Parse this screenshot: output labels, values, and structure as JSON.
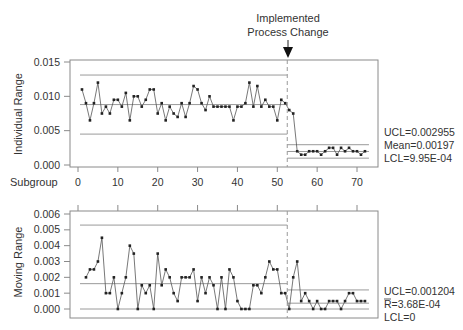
{
  "annotation": {
    "line1": "Implemented",
    "line2": "Process Change",
    "subgroup": 52.5
  },
  "chart_data": [
    {
      "type": "line",
      "title": "Individuals Chart",
      "xlabel": "Subgroup",
      "ylabel": "Individual Range",
      "xlim": [
        0,
        72
      ],
      "ylim": [
        0,
        0.015
      ],
      "x_ticks": [
        "0",
        "10",
        "20",
        "30",
        "40",
        "50",
        "60",
        "70"
      ],
      "y_ticks": [
        "0.000",
        "0.005",
        "0.010",
        "0.015"
      ],
      "phase1": {
        "ucl": 0.0131,
        "mean": 0.0088,
        "lcl": 0.0045
      },
      "phase2": {
        "ucl": 0.002955,
        "mean": 0.00197,
        "lcl": 0.000995
      },
      "stats_labels": [
        "UCL=0.002955",
        "Mean=0.00197",
        "LCL=9.95E-04"
      ],
      "series": [
        {
          "name": "Individual",
          "x": [
            1,
            2,
            3,
            4,
            5,
            6,
            7,
            8,
            9,
            10,
            11,
            12,
            13,
            14,
            15,
            16,
            17,
            18,
            19,
            20,
            21,
            22,
            23,
            24,
            25,
            26,
            27,
            28,
            29,
            30,
            31,
            32,
            33,
            34,
            35,
            36,
            37,
            38,
            39,
            40,
            41,
            42,
            43,
            44,
            45,
            46,
            47,
            48,
            49,
            50,
            51,
            52,
            53,
            54,
            55,
            56,
            57,
            58,
            59,
            60,
            61,
            62,
            63,
            64,
            65,
            66,
            67,
            68,
            69,
            70,
            71,
            72
          ],
          "values": [
            0.011,
            0.009,
            0.0065,
            0.009,
            0.012,
            0.0075,
            0.0085,
            0.0075,
            0.0095,
            0.0095,
            0.0085,
            0.0105,
            0.0065,
            0.01,
            0.01,
            0.0085,
            0.0095,
            0.011,
            0.011,
            0.0075,
            0.009,
            0.0065,
            0.0085,
            0.0075,
            0.007,
            0.009,
            0.007,
            0.009,
            0.0115,
            0.011,
            0.009,
            0.008,
            0.01,
            0.0085,
            0.0085,
            0.0085,
            0.0085,
            0.0085,
            0.0065,
            0.0085,
            0.0085,
            0.009,
            0.012,
            0.0085,
            0.0115,
            0.0085,
            0.0095,
            0.0085,
            0.0085,
            0.0065,
            0.0095,
            0.009,
            0.008,
            0.0075,
            0.002,
            0.0015,
            0.0015,
            0.002,
            0.002,
            0.002,
            0.0015,
            0.002,
            0.0025,
            0.0025,
            0.0015,
            0.0025,
            0.002,
            0.0025,
            0.002,
            0.002,
            0.0015,
            0.002,
            0.002,
            0.002
          ]
        }
      ]
    },
    {
      "type": "line",
      "title": "Moving Range Chart",
      "xlabel": "",
      "ylabel": "Moving Range",
      "xlim": [
        0,
        72
      ],
      "ylim": [
        0,
        0.006
      ],
      "y_ticks": [
        "0.000",
        "0.001",
        "0.002",
        "0.003",
        "0.004",
        "0.005",
        "0.006"
      ],
      "phase1": {
        "ucl": 0.0053,
        "mean": 0.0016,
        "lcl": 0
      },
      "phase2": {
        "ucl": 0.001204,
        "mean": 0.000368,
        "lcl": 0
      },
      "stats_labels": [
        "UCL=0.001204",
        "R=3.68E-04",
        "LCL=0"
      ],
      "series": [
        {
          "name": "Moving Range",
          "x": [
            2,
            3,
            4,
            5,
            6,
            7,
            8,
            9,
            10,
            11,
            12,
            13,
            14,
            15,
            16,
            17,
            18,
            19,
            20,
            21,
            22,
            23,
            24,
            25,
            26,
            27,
            28,
            29,
            30,
            31,
            32,
            33,
            34,
            35,
            36,
            37,
            38,
            39,
            40,
            41,
            42,
            43,
            44,
            45,
            46,
            47,
            48,
            49,
            50,
            51,
            52,
            53,
            54,
            55,
            56,
            57,
            58,
            59,
            60,
            61,
            62,
            63,
            64,
            65,
            66,
            67,
            68,
            69,
            70,
            71,
            72
          ],
          "values": [
            0.002,
            0.0025,
            0.0025,
            0.003,
            0.0045,
            0.001,
            0.001,
            0.002,
            0.0,
            0.001,
            0.002,
            0.004,
            0.0035,
            0.0,
            0.0015,
            0.001,
            0.0015,
            0.0,
            0.0035,
            0.0015,
            0.0025,
            0.002,
            0.001,
            0.0005,
            0.002,
            0.002,
            0.002,
            0.0025,
            0.0005,
            0.002,
            0.001,
            0.002,
            0.0015,
            0.0,
            0.002,
            0.0,
            0.0025,
            0.002,
            0.0005,
            0.0,
            0.0,
            0.0,
            0.0015,
            0.0015,
            0.001,
            0.002,
            0.003,
            0.0025,
            0.0025,
            0.001,
            0.001,
            0.0,
            0.002,
            0.003,
            0.0005,
            0.001,
            0.0005,
            0.0,
            0.0005,
            0.0,
            0.0,
            0.0005,
            0.0005,
            0.0005,
            0.0,
            0.0005,
            0.001,
            0.001,
            0.0005,
            0.0005,
            0.0005,
            0.0,
            0.0005,
            0.0005,
            0.0,
            0.0
          ]
        }
      ]
    }
  ],
  "colors": {
    "frame": "#8a8a8a",
    "limit_line": "#9a9a9a",
    "data_line": "#555555",
    "marker": "#222222",
    "change_line": "#999999"
  }
}
